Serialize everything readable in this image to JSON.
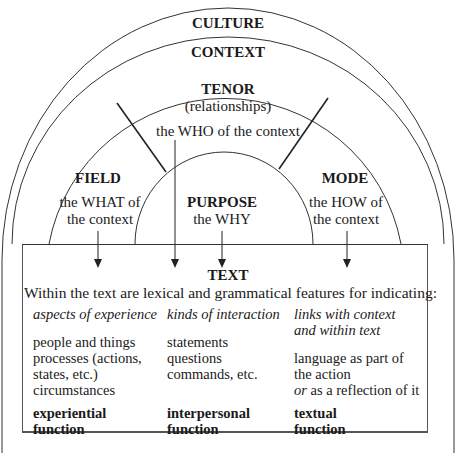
{
  "diagram": {
    "rings": {
      "culture": "CULTURE",
      "context": "CONTEXT"
    },
    "tenor": {
      "title": "TENOR",
      "subtitle": "(relationships)",
      "description": "the WHO of the context"
    },
    "field": {
      "title": "FIELD",
      "line1": "the WHAT of",
      "line2": "the context"
    },
    "purpose": {
      "title": "PURPOSE",
      "description": "the WHY"
    },
    "mode": {
      "title": "MODE",
      "line1": "the HOW of",
      "line2": "the context"
    },
    "text_box": {
      "title": "TEXT",
      "intro": "Within the text are lexical and grammatical features for indicating:",
      "columns": [
        {
          "heading_lines": [
            "aspects of experience"
          ],
          "items": [
            "people and things",
            "processes (actions,",
            "states, etc.)",
            "circumstances"
          ],
          "function_lines": [
            "experiential",
            "function"
          ]
        },
        {
          "heading_lines": [
            "kinds of interaction"
          ],
          "items": [
            "statements",
            "questions",
            "commands, etc."
          ],
          "function_lines": [
            "interpersonal",
            "function"
          ]
        },
        {
          "heading_lines": [
            "links with context",
            "and within text"
          ],
          "items": [
            "language as part of",
            "the action"
          ],
          "item_or": "or",
          "item_last": " as a reflection of it",
          "function_lines": [
            "textual",
            "function"
          ]
        }
      ]
    },
    "colors": {
      "line": "#333333",
      "text": "#1a1a1a",
      "background": "#ffffff"
    }
  }
}
